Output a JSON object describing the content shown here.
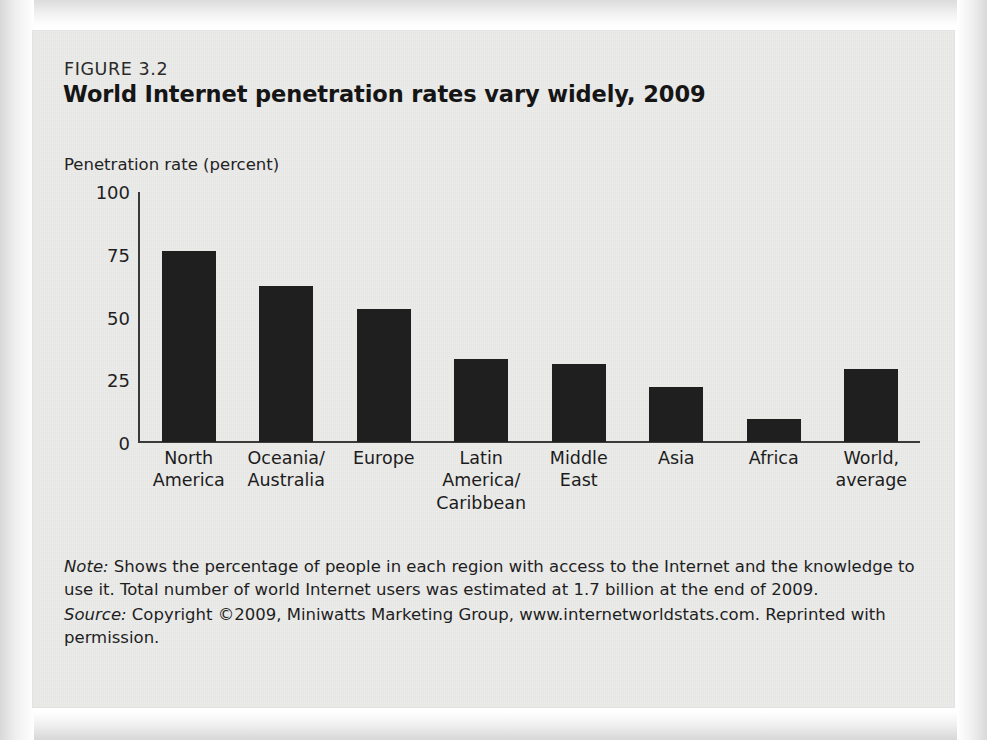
{
  "figure": {
    "number": "FIGURE 3.2",
    "title": "World Internet penetration rates vary widely, 2009"
  },
  "notes": {
    "note_label": "Note:",
    "note_text": " Shows the percentage of people in each region with access to the Internet and the knowledge to use it. Total number of world Internet users was estimated at 1.7 billion at the end of 2009.",
    "source_label": "Source:",
    "source_text": " Copyright ©2009, Miniwatts Marketing Group, www.internetworldstats.com. Reprinted with permission."
  },
  "colors": {
    "bar": "#1f1f1f",
    "axis": "#3a3a3a",
    "card_background": "#ececeb",
    "text": "#1e1e1e"
  },
  "chart_data": {
    "type": "bar",
    "title": "World Internet penetration rates vary widely, 2009",
    "subtitle": "FIGURE 3.2",
    "xlabel": "",
    "ylabel": "Penetration rate (percent)",
    "ylim": [
      0,
      100
    ],
    "yticks": [
      100,
      75,
      50,
      25,
      0
    ],
    "grid": false,
    "legend": null,
    "categories": [
      "North\nAmerica",
      "Oceania/\nAustralia",
      "Europe",
      "Latin\nAmerica/\nCaribbean",
      "Middle\nEast",
      "Asia",
      "Africa",
      "World,\naverage"
    ],
    "values": [
      76,
      62,
      53,
      33,
      31,
      22,
      9,
      29
    ],
    "bars": [
      {
        "label_lines": [
          "North",
          "America"
        ],
        "value": 76
      },
      {
        "label_lines": [
          "Oceania/",
          "Australia"
        ],
        "value": 62
      },
      {
        "label_lines": [
          "Europe"
        ],
        "value": 53
      },
      {
        "label_lines": [
          "Latin",
          "America/",
          "Caribbean"
        ],
        "value": 33
      },
      {
        "label_lines": [
          "Middle",
          "East"
        ],
        "value": 31
      },
      {
        "label_lines": [
          "Asia"
        ],
        "value": 22
      },
      {
        "label_lines": [
          "Africa"
        ],
        "value": 9
      },
      {
        "label_lines": [
          "World,",
          "average"
        ],
        "value": 29
      }
    ]
  }
}
